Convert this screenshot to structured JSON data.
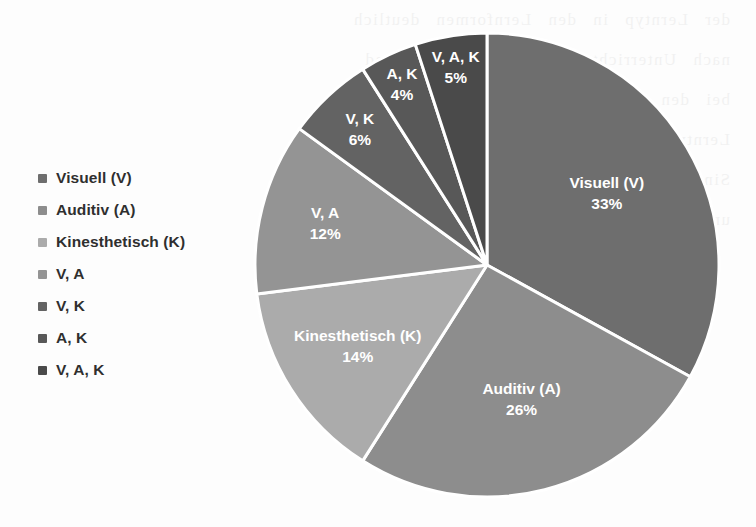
{
  "background_color": "#fdfdfd",
  "scan_artifact": {
    "description": "faint bleed-through text from reverse side of scanned page",
    "lines": [
      "der Lerntyp  in  den  Lernformen  deutlich",
      "nach  Unterrichtsformen  wie  nachstehend",
      "bei  den  Lernenden  unterschiedlich  stark",
      "Lerntypen  nach  Vester  lassen  sich  die",
      "Sinneskanale  im  Lernprozess  einsetzen",
      "und  in  der  Praxis  sinnvoll  kombinieren"
    ]
  },
  "chart_data": {
    "type": "pie",
    "title": "",
    "subtitle": "",
    "xlabel": "",
    "ylabel": "",
    "grid": false,
    "legend_position": "left",
    "start_angle_deg": 0,
    "direction": "clockwise",
    "units": "%",
    "categories": [
      "Visuell (V)",
      "Auditiv (A)",
      "Kinesthetisch (K)",
      "V, A",
      "V, K",
      "A, K",
      "V, A, K"
    ],
    "values": [
      33,
      26,
      14,
      12,
      6,
      4,
      5
    ],
    "value_labels": [
      "33%",
      "26%",
      "14%",
      "12%",
      "6%",
      "4%",
      "5%"
    ],
    "colors": [
      "#6e6e6e",
      "#8d8d8d",
      "#ababab",
      "#949494",
      "#636363",
      "#585858",
      "#4a4a4a"
    ],
    "slice_border_color": "#ffffff",
    "slice_label_color": "#ffffff",
    "total": 100,
    "slices": [
      {
        "label": "Visuell (V)",
        "value": 33,
        "value_label": "33%",
        "color": "#6e6e6e"
      },
      {
        "label": "Auditiv (A)",
        "value": 26,
        "value_label": "26%",
        "color": "#8d8d8d"
      },
      {
        "label": "Kinesthetisch (K)",
        "value": 14,
        "value_label": "14%",
        "color": "#ababab"
      },
      {
        "label": "V, A",
        "value": 12,
        "value_label": "12%",
        "color": "#949494"
      },
      {
        "label": "V, K",
        "value": 6,
        "value_label": "6%",
        "color": "#636363"
      },
      {
        "label": "A, K",
        "value": 4,
        "value_label": "4%",
        "color": "#585858"
      },
      {
        "label": "V, A, K",
        "value": 5,
        "value_label": "5%",
        "color": "#4a4a4a"
      }
    ]
  },
  "legend": {
    "items": [
      {
        "label": "Visuell (V)",
        "color": "#6e6e6e"
      },
      {
        "label": "Auditiv (A)",
        "color": "#8d8d8d"
      },
      {
        "label": "Kinesthetisch (K)",
        "color": "#ababab"
      },
      {
        "label": "V, A",
        "color": "#949494"
      },
      {
        "label": "V, K",
        "color": "#636363"
      },
      {
        "label": "A, K",
        "color": "#585858"
      },
      {
        "label": "V, A, K",
        "color": "#4a4a4a"
      }
    ]
  }
}
